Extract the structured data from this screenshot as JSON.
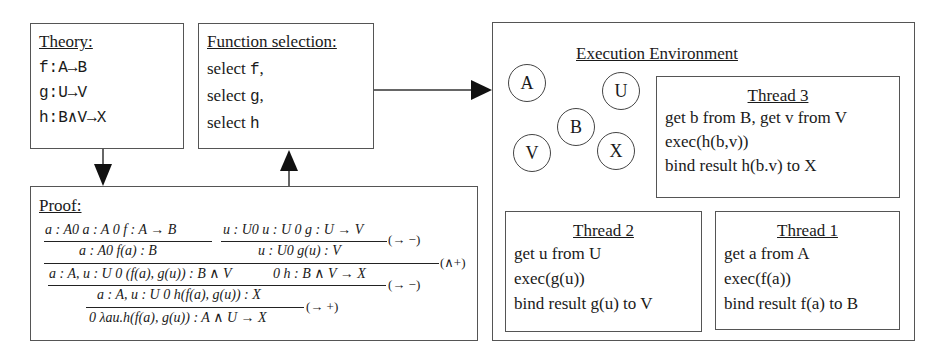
{
  "theory": {
    "title": "Theory:",
    "lines": [
      "f:A→B",
      "g:U→V",
      "h:B∧V→X"
    ]
  },
  "function_selection": {
    "title": "Function selection:",
    "lines": [
      {
        "prefix": "select ",
        "fn": "f",
        "suffix": ","
      },
      {
        "prefix": "select ",
        "fn": "g",
        "suffix": ","
      },
      {
        "prefix": "select ",
        "fn": "h",
        "suffix": ""
      }
    ]
  },
  "proof": {
    "title": "Proof:",
    "step1_left_premise": "a : A0 a : A   0 f : A → B",
    "step1_left_conclusion": "a : A0 f(a) : B",
    "step1_right_premise": "u : U0 u : U   0 g : U → V",
    "step1_right_conclusion": "u : U0 g(u) : V",
    "step1_rule": "(→ −)",
    "step2_rule": "(∧+)",
    "step2_conclusion_left": "a : A, u : U 0 (f(a), g(u)) : B ∧ V",
    "step2_conclusion_right": "0 h : B ∧ V → X",
    "step3_rule": "(→ −)",
    "step3_conclusion": "a : A, u : U 0 h(f(a), g(u)) : X",
    "step4_rule": "(→ +)",
    "step4_conclusion": "0  λau.h(f(a), g(u)) : A ∧ U → X"
  },
  "execution_environment": {
    "title": "Execution Environment",
    "nodes": [
      "A",
      "U",
      "B",
      "V",
      "X"
    ],
    "threads": [
      {
        "title": "Thread 3",
        "lines": [
          "get b from B, get v from V",
          "exec(h(b,v))",
          "bind result h(b.v) to X"
        ]
      },
      {
        "title": "Thread 2",
        "lines": [
          "get u from U",
          "exec(g(u))",
          "bind result g(u) to V"
        ]
      },
      {
        "title": "Thread 1",
        "lines": [
          "get a from A",
          "exec(f(a))",
          "bind result f(a) to B"
        ]
      }
    ]
  }
}
